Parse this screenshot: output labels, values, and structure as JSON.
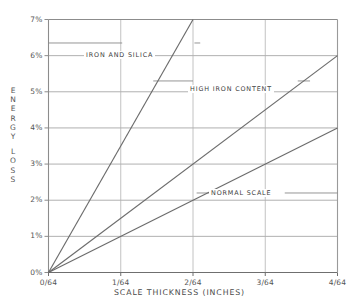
{
  "chart_data": {
    "type": "line",
    "title": "",
    "xlabel": "SCALE THICKNESS (INCHES)",
    "ylabel": "ENERGY LOSS",
    "ylabel_lines": [
      "ENERGY",
      "LOSS"
    ],
    "x": [
      0,
      1,
      2,
      3,
      4
    ],
    "categories": [
      "0/64",
      "1/64",
      "2/64",
      "3/64",
      "4/64"
    ],
    "xtick_labels": [
      "0/64",
      "1/64",
      "2/64",
      "3/64",
      "4/64"
    ],
    "ytick_labels": [
      "0%",
      "1%",
      "2%",
      "3%",
      "4%",
      "5%",
      "6%",
      "7%"
    ],
    "ytick_values": [
      0,
      1,
      2,
      3,
      4,
      5,
      6,
      7
    ],
    "xlim": [
      0,
      4
    ],
    "ylim": [
      0,
      7
    ],
    "grid": true,
    "legend": "inline-labels",
    "series": [
      {
        "name": "IRON AND SILICA",
        "x": [
          0,
          2
        ],
        "values": [
          0,
          7
        ],
        "slope_percent_per_64th": 3.5,
        "color": "#6b6b6b"
      },
      {
        "name": "HIGH IRON CONTENT",
        "x": [
          0,
          4
        ],
        "values": [
          0,
          6
        ],
        "slope_percent_per_64th": 1.5,
        "color": "#6b6b6b"
      },
      {
        "name": "NORMAL SCALE",
        "x": [
          0,
          4
        ],
        "values": [
          0,
          4
        ],
        "slope_percent_per_64th": 1.0,
        "color": "#6b6b6b"
      }
    ],
    "annotations": [
      {
        "text": "IRON AND SILICA",
        "x": 1.05,
        "y": 6.35
      },
      {
        "text": "HIGH IRON CONTENT",
        "x": 2.05,
        "y": 5.3
      },
      {
        "text": "NORMAL SCALE",
        "x": 2.3,
        "y": 2.2
      }
    ]
  },
  "colors": {
    "background": "#ffffff",
    "axis": "#8c8c8c",
    "gridline_horizontal": "#b0b0b0",
    "gridline_vertical": "#c2c2c2",
    "series_line": "#6b6b6b",
    "leader_line": "#8a8a8a",
    "text": "#4a4a4a"
  }
}
